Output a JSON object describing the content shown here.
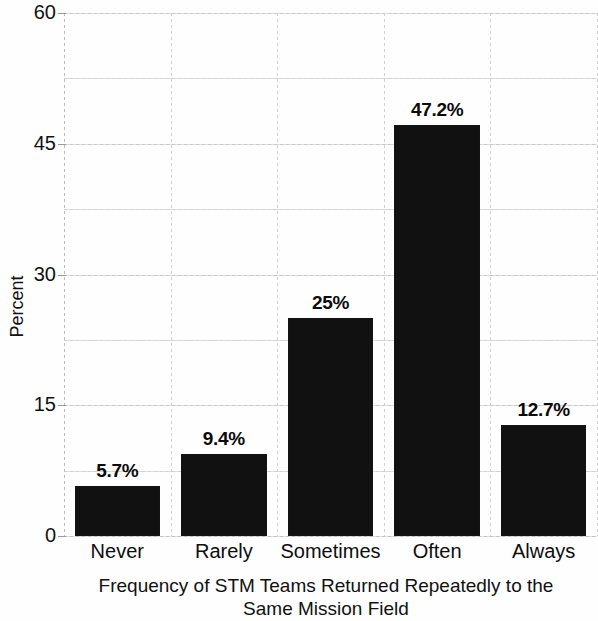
{
  "chart_data": {
    "type": "bar",
    "title": "",
    "subtitle": "",
    "xlabel": "Frequency of STM Teams Returned Repeatedly to the Same Mission Field",
    "xlabel_line1": "Frequency of STM Teams Returned Repeatedly to the",
    "xlabel_line2": "Same Mission Field",
    "ylabel": "Percent",
    "categories": [
      "Never",
      "Rarely",
      "Sometimes",
      "Often",
      "Always"
    ],
    "values": [
      5.7,
      9.4,
      25,
      47.2,
      12.7
    ],
    "value_labels": [
      "5.7%",
      "9.4%",
      "25%",
      "47.2%",
      "12.7%"
    ],
    "ylim": [
      0,
      60
    ],
    "yticks": [
      0,
      15,
      30,
      45,
      60
    ],
    "ytick_labels": [
      "0",
      "15",
      "30",
      "45",
      "60"
    ],
    "minor_gridline_step": 7.5,
    "grid": true,
    "grid_style": "dotted",
    "legend": false,
    "legend_position": "none",
    "bar_color": "#111111",
    "grid_color": "#d0d0d0",
    "background_color": "#ffffff",
    "text_color": "#111111"
  },
  "axis": {
    "y_title": "Percent",
    "x_title_line1": "Frequency of STM Teams Returned Repeatedly to the",
    "x_title_line2": "Same Mission Field"
  },
  "yticks": [
    {
      "label": "60"
    },
    {
      "label": "45"
    },
    {
      "label": "30"
    },
    {
      "label": "15"
    },
    {
      "label": "0"
    }
  ],
  "bars": [
    {
      "label": "Never",
      "value_label": "5.7%"
    },
    {
      "label": "Rarely",
      "value_label": "9.4%"
    },
    {
      "label": "Sometimes",
      "value_label": "25%"
    },
    {
      "label": "Often",
      "value_label": "47.2%"
    },
    {
      "label": "Always",
      "value_label": "12.7%"
    }
  ]
}
